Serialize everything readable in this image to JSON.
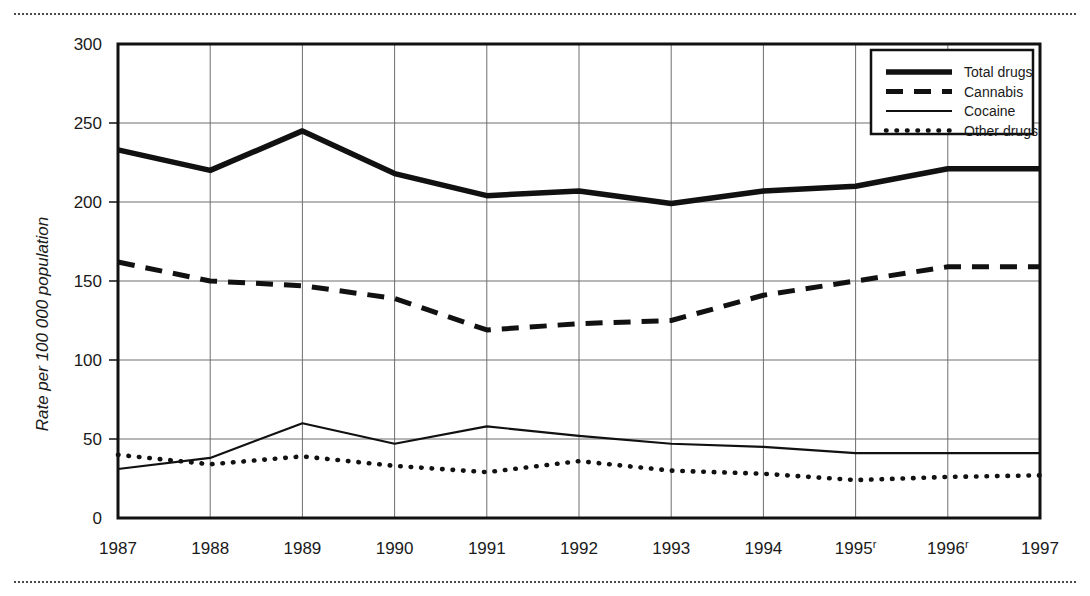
{
  "figure": {
    "top_rule": "dotted-divider",
    "bottom_rule": "dotted-divider"
  },
  "chart_data": {
    "type": "line",
    "title": "",
    "xlabel": "",
    "ylabel": "Rate per 100 000 population",
    "x": [
      "1987",
      "1988",
      "1989",
      "1990",
      "1991",
      "1992",
      "1993",
      "1994",
      "1995",
      "1996",
      "1997"
    ],
    "x_tick_labels": [
      "1987",
      "1988",
      "1989",
      "1990",
      "1991",
      "1992",
      "1993",
      "1994",
      "1995",
      "1996",
      "1997"
    ],
    "x_tick_superscripts": [
      "",
      "",
      "",
      "",
      "",
      "",
      "",
      "",
      "r",
      "r",
      ""
    ],
    "ylim": [
      0,
      300
    ],
    "y_ticks": [
      0,
      50,
      100,
      150,
      200,
      250,
      300
    ],
    "y_tick_labels": [
      "0",
      "50",
      "100",
      "150",
      "200",
      "250",
      "300"
    ],
    "grid": true,
    "legend_position": "top-right",
    "series": [
      {
        "name": "Total drugs",
        "style": "thick-solid",
        "values": [
          233,
          220,
          245,
          218,
          204,
          207,
          199,
          207,
          210,
          221,
          221
        ]
      },
      {
        "name": "Cannabis",
        "style": "dashed",
        "values": [
          162,
          150,
          147,
          139,
          119,
          123,
          125,
          141,
          150,
          159,
          159
        ]
      },
      {
        "name": "Cocaine",
        "style": "thin-solid",
        "values": [
          31,
          38,
          60,
          47,
          58,
          52,
          47,
          45,
          41,
          41,
          41
        ]
      },
      {
        "name": "Other drugs",
        "style": "dotted",
        "values": [
          40,
          34,
          39,
          33,
          29,
          36,
          30,
          28,
          24,
          26,
          27
        ]
      }
    ]
  },
  "legend": {
    "entries": [
      {
        "label": "Total drugs"
      },
      {
        "label": "Cannabis"
      },
      {
        "label": "Cocaine"
      },
      {
        "label": "Other drugs"
      }
    ]
  }
}
